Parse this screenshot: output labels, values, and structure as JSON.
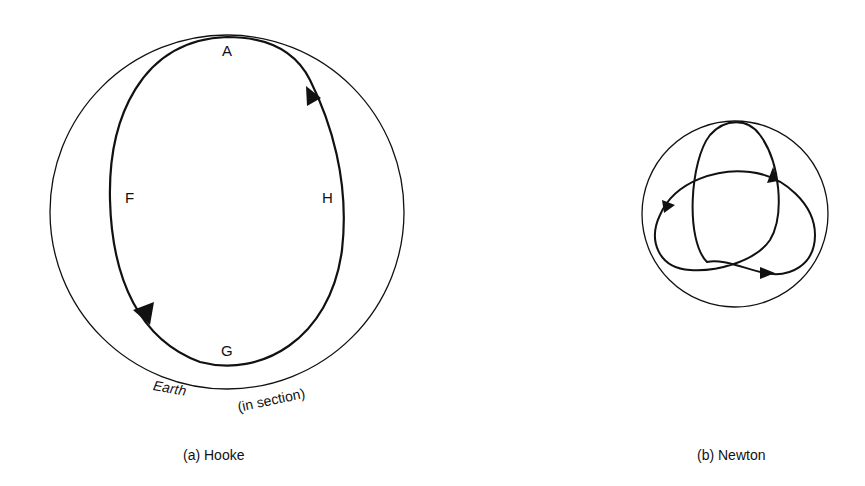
{
  "figure": {
    "panels": [
      {
        "id": "hooke",
        "caption": "(a) Hooke",
        "earth_label": "Earth",
        "earth_sublabel": "(in section)",
        "points": {
          "A": "A",
          "F": "F",
          "G": "G",
          "H": "H"
        }
      },
      {
        "id": "newton",
        "caption": "(b) Newton"
      }
    ]
  },
  "colors": {
    "stroke": "#111111",
    "background": "#ffffff"
  }
}
